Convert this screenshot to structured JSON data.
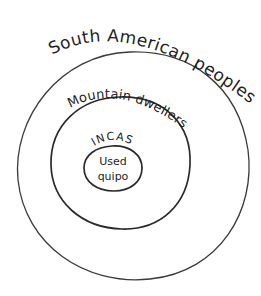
{
  "diagram": {
    "type": "nested-sets",
    "style": "hand-drawn",
    "background": "#ffffff",
    "stroke_color": "#2a2a2a",
    "sets": [
      {
        "id": "outer",
        "label": "South American peoples",
        "contains": "middle"
      },
      {
        "id": "middle",
        "label": "Mountain dwellers",
        "contains": "inner"
      },
      {
        "id": "inner",
        "label": "INCAS",
        "contents": [
          "Used",
          "quipo"
        ]
      }
    ]
  }
}
